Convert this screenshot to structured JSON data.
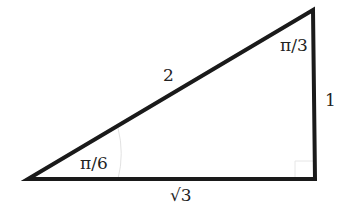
{
  "diagram": {
    "type": "right-triangle",
    "vertices": {
      "A": {
        "x": 28,
        "y": 179
      },
      "B": {
        "x": 315,
        "y": 179
      },
      "C": {
        "x": 313,
        "y": 10
      }
    },
    "sides": {
      "hypotenuse": "2",
      "vertical": "1",
      "base": "√3"
    },
    "angles": {
      "bottom_left": "π/6",
      "top_right": "π/3"
    },
    "colors": {
      "stroke": "#1a1a1a",
      "marker": "#dddddd",
      "text": "#222222"
    }
  }
}
